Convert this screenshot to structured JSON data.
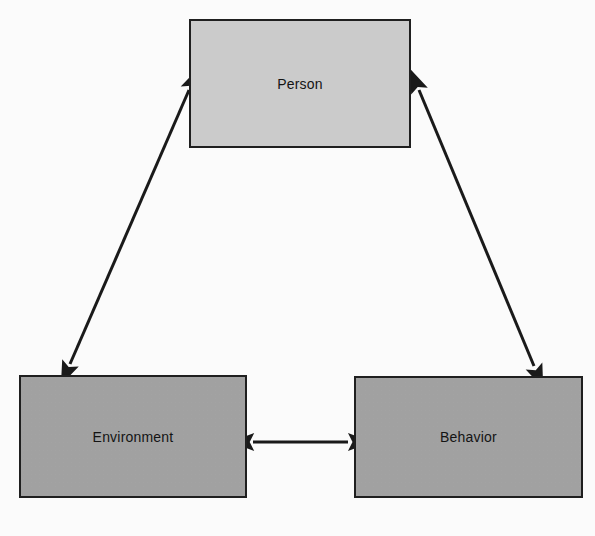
{
  "figure": {
    "kind": "triangular-reciprocal-model-diagram",
    "background_color": "#fdfdfd",
    "width": 595,
    "height": 536,
    "ghost_text": {
      "line1": "",
      "line2": "",
      "line3": ""
    }
  },
  "nodes": [
    {
      "id": "person",
      "label": "Person",
      "fill": "#cdcdcd",
      "border_color": "#1f1f1f",
      "shadow_color": "#c9c9c9",
      "x": 189,
      "y": 19,
      "width": 222,
      "height": 129
    },
    {
      "id": "environment",
      "label": "Environment",
      "fill": "#a3a3a3",
      "border_color": "#1f1f1f",
      "shadow_color": "#c9c9c9",
      "x": 19,
      "y": 375,
      "width": 228,
      "height": 123
    },
    {
      "id": "behavior",
      "label": "Behavior",
      "fill": "#a3a3a3",
      "border_color": "#1f1f1f",
      "shadow_color": "#c9c9c9",
      "x": 354,
      "y": 376,
      "width": 229,
      "height": 122
    }
  ],
  "edges": [
    {
      "id": "person-environment",
      "from": "environment",
      "to": "person",
      "style": "double-headed-arrow",
      "color": "#1a1a1a",
      "x1": 70,
      "y1": 364,
      "x2": 189,
      "y2": 90
    },
    {
      "id": "person-behavior",
      "from": "person",
      "to": "behavior",
      "style": "double-headed-arrow",
      "color": "#1a1a1a",
      "x1": 419,
      "y1": 90,
      "x2": 534,
      "y2": 366
    },
    {
      "id": "environment-behavior",
      "from": "environment",
      "to": "behavior",
      "style": "double-headed-arrow",
      "color": "#1a1a1a",
      "x1": 253,
      "y1": 442,
      "x2": 348,
      "y2": 442
    }
  ]
}
